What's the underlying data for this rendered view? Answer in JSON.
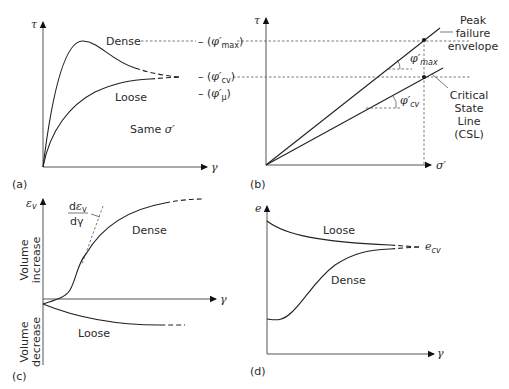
{
  "panels": {
    "a": {
      "label": "(a)",
      "y_axis": "τ",
      "x_axis": "γ",
      "curves": {
        "dense": "Dense",
        "loose": "Loose"
      },
      "note_prefix": "Same ",
      "note_symbol": "σ′",
      "markers": {
        "max": {
          "dash": "– (",
          "sym": "φ′",
          "sub": "max",
          "close": ")"
        },
        "cv": {
          "dash": "– (",
          "sym": "φ′",
          "sub": "cv",
          "close": ")"
        },
        "mu": {
          "dash": "– (",
          "sym": "φ′",
          "sub": "μ",
          "close": ")"
        }
      }
    },
    "b": {
      "label": "(b)",
      "y_axis": "τ",
      "x_axis": "σ′",
      "angle_max": {
        "sym": "φ′",
        "sub": "max"
      },
      "angle_cv": {
        "sym": "φ′",
        "sub": "cv"
      },
      "peak_envelope": [
        "Peak",
        "failure",
        "envelope"
      ],
      "csl": [
        "Critical",
        "State",
        "Line",
        "(CSL)"
      ]
    },
    "c": {
      "label": "(c)",
      "y_axis": {
        "sym": "ε",
        "sub": "v"
      },
      "x_axis": "γ",
      "slope": {
        "num_d": "d",
        "num_sym": "ε",
        "num_sub": "v",
        "den": "dγ"
      },
      "volume_increase": [
        "Volume",
        "increase"
      ],
      "volume_decrease": [
        "Volume",
        "decrease"
      ],
      "curves": {
        "dense": "Dense",
        "loose": "Loose"
      }
    },
    "d": {
      "label": "(d)",
      "y_axis": "e",
      "x_axis": "γ",
      "curves": {
        "loose": "Loose",
        "dense": "Dense"
      },
      "ecv": {
        "sym": "e",
        "sub": "cv"
      }
    }
  }
}
